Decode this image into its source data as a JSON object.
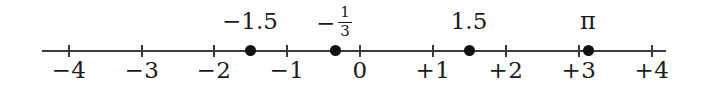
{
  "figure": {
    "name": "number-line",
    "background_color": "#ffffff",
    "ink_color": "#3b3b3b",
    "dot_color": "#111111"
  },
  "chart_data": {
    "type": "scatter",
    "title": "",
    "xlabel": "",
    "ylabel": "",
    "xlim": [
      -4.25,
      4.25
    ],
    "grid": false,
    "legend": false,
    "axis": {
      "orientation": "horizontal",
      "line_start_x": 42,
      "line_end_x": 666,
      "line_y": 50,
      "pixels_per_unit": 72.9,
      "origin_px": 359
    },
    "ticks": [
      {
        "value": -4,
        "label": "−4",
        "x_px": 68
      },
      {
        "value": -3,
        "label": "−3",
        "x_px": 141
      },
      {
        "value": -2,
        "label": "−2",
        "x_px": 213
      },
      {
        "value": -1,
        "label": "−1",
        "x_px": 286
      },
      {
        "value": 0,
        "label": "0",
        "x_px": 359
      },
      {
        "value": 1,
        "label": "+1",
        "x_px": 432
      },
      {
        "value": 2,
        "label": "+2",
        "x_px": 505
      },
      {
        "value": 3,
        "label": "+3",
        "x_px": 578
      },
      {
        "value": 4,
        "label": "+4",
        "x_px": 651
      }
    ],
    "points": [
      {
        "value": -1.5,
        "label": "−1.5",
        "label_kind": "plain",
        "x_px": 250
      },
      {
        "value": -0.3333,
        "label": "−1/3",
        "label_kind": "fraction",
        "sign": "−",
        "numerator": "1",
        "denominator": "3",
        "x_px": 335
      },
      {
        "value": 1.5,
        "label": "1.5",
        "label_kind": "plain",
        "x_px": 469
      },
      {
        "value": 3.14159,
        "label": "π",
        "label_kind": "pi",
        "x_px": 588
      }
    ]
  }
}
